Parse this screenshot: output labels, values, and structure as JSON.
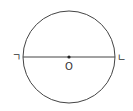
{
  "diagram": {
    "type": "circle-with-diameter",
    "circle": {
      "cx": 69,
      "cy": 57,
      "r": 46,
      "stroke": "#444444"
    },
    "diameter": {
      "x1": 23,
      "y1": 57,
      "x2": 115,
      "y2": 57,
      "stroke": "#444444"
    },
    "center_point": {
      "x": 69,
      "y": 57,
      "color": "#222222"
    },
    "labels": {
      "left_endpoint": "ㄱ",
      "right_endpoint": "ㄴ",
      "center": "O"
    }
  }
}
